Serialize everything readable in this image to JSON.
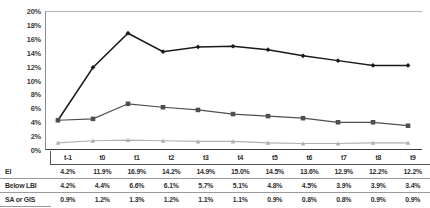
{
  "chart_data": {
    "type": "line",
    "title": "",
    "xlabel": "",
    "ylabel": "",
    "ylim": [
      0,
      20
    ],
    "ytick_labels": [
      "20%",
      "18%",
      "16%",
      "14%",
      "12%",
      "10%",
      "8%",
      "6%",
      "4%",
      "2%",
      "0%"
    ],
    "ytick_values": [
      20,
      18,
      16,
      14,
      12,
      10,
      8,
      6,
      4,
      2,
      0
    ],
    "grid": false,
    "legend_position": "none",
    "categories": [
      "t-1",
      "t0",
      "t1",
      "t2",
      "t3",
      "t4",
      "t5",
      "t6",
      "t7",
      "t8",
      "t9"
    ],
    "series": [
      {
        "name": "EI",
        "marker": "diamond",
        "color": "#1a1a1a",
        "values": [
          4.2,
          11.9,
          16.9,
          14.2,
          14.9,
          15.0,
          14.5,
          13.6,
          12.9,
          12.2,
          12.2
        ],
        "labels": [
          "4.2%",
          "11.9%",
          "16.9%",
          "14.2%",
          "14.9%",
          "15.0%",
          "14.5%",
          "13.6%",
          "12.9%",
          "12.2%",
          "12.2%"
        ]
      },
      {
        "name": "Below LBI",
        "marker": "square",
        "color": "#4f4f4f",
        "values": [
          4.2,
          4.4,
          6.6,
          6.1,
          5.7,
          5.1,
          4.8,
          4.5,
          3.9,
          3.9,
          3.4
        ],
        "labels": [
          "4.2%",
          "4.4%",
          "6.6%",
          "6.1%",
          "5.7%",
          "5.1%",
          "4.8%",
          "4.5%",
          "3.9%",
          "3.9%",
          "3.4%"
        ]
      },
      {
        "name": "SA or GIS",
        "marker": "triangle",
        "color": "#b0b0b0",
        "values": [
          0.9,
          1.2,
          1.3,
          1.2,
          1.1,
          1.1,
          0.9,
          0.8,
          0.8,
          0.9,
          0.9
        ],
        "labels": [
          "0.9%",
          "1.2%",
          "1.3%",
          "1.2%",
          "1.1%",
          "1.1%",
          "0.9%",
          "0.8%",
          "0.8%",
          "0.9%",
          "0.9%"
        ]
      }
    ]
  },
  "table": {
    "header": [
      "",
      "t-1",
      "t0",
      "t1",
      "t2",
      "t3",
      "t4",
      "t5",
      "t6",
      "t7",
      "t8",
      "t9"
    ],
    "rows": [
      {
        "label": "EI",
        "values": [
          "4.2%",
          "11.9%",
          "16.9%",
          "14.2%",
          "14.9%",
          "15.0%",
          "14.5%",
          "13.6%",
          "12.9%",
          "12.2%",
          "12.2%"
        ]
      },
      {
        "label": "Below LBI",
        "values": [
          "4.2%",
          "4.4%",
          "6.6%",
          "6.1%",
          "5.7%",
          "5.1%",
          "4.8%",
          "4.5%",
          "3.9%",
          "3.9%",
          "3.4%"
        ]
      },
      {
        "label": "SA or GIS",
        "values": [
          "0.9%",
          "1.2%",
          "1.3%",
          "1.2%",
          "1.1%",
          "1.1%",
          "0.9%",
          "0.8%",
          "0.8%",
          "0.9%",
          "0.9%"
        ]
      }
    ]
  }
}
